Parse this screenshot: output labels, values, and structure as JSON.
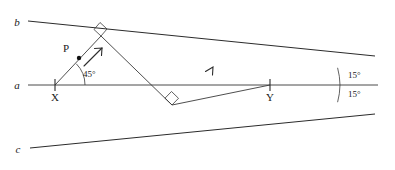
{
  "diagram": {
    "background_color": "#ffffff",
    "stroke_color": "#2b2b2b",
    "width": 395,
    "height": 170,
    "line_labels": {
      "b": "b",
      "a": "a",
      "c": "c"
    },
    "point_labels": {
      "P": "P",
      "X": "X",
      "Y": "Y"
    },
    "angle_labels": {
      "at_x": "45°",
      "upper_right": "15°",
      "lower_right": "15°"
    },
    "markers": {
      "right_angle_top": "right-angle",
      "right_angle_bottom": "right-angle",
      "tick_x": "tick",
      "tick_y": "tick",
      "direction_arrow_1": "arrow-up-right",
      "direction_arrow_2": "arrow-up-right"
    }
  },
  "geometry": {
    "line_a": {
      "x1": 28,
      "y1": 85,
      "x2": 378,
      "y2": 85
    },
    "line_b": {
      "x1": 28,
      "y1": 21,
      "x2": 375,
      "y2": 56
    },
    "line_c": {
      "x1": 30,
      "y1": 148,
      "x2": 375,
      "y2": 114
    },
    "vertex_Y": {
      "x": 270,
      "y": 85
    },
    "point_X": {
      "x": 55,
      "y": 85
    },
    "point_P": {
      "x": 79,
      "y": 58
    },
    "reflect_top": {
      "x": 101,
      "y": 36
    },
    "reflect_bottom": {
      "x": 172,
      "y": 105
    }
  }
}
